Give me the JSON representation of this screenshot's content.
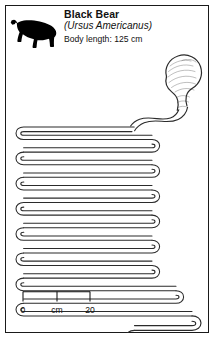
{
  "card": {
    "header": {
      "icon": "black-bear-silhouette-icon",
      "common_name": "Black Bear",
      "latin_name": "(Ursus Americanus)",
      "body_length_label": "Body length:",
      "body_length_value": "125 cm",
      "body_length_full": "Body length:  125 cm"
    },
    "diagram": {
      "title": "black-bear-digestive-tract",
      "parts": [
        {
          "name": "stomach",
          "label": ""
        },
        {
          "name": "small-intestine-coils",
          "label": ""
        },
        {
          "name": "large-intestine-colon",
          "label": ""
        },
        {
          "name": "rectum-terminus",
          "label": ""
        }
      ],
      "stroke_color": "#2b2b2b",
      "fill_color": "#ffffff"
    },
    "scale_bar": {
      "start_label": "0",
      "unit_label": "cm",
      "end_label": "20",
      "ticks": [
        "0",
        "cm",
        "20"
      ]
    },
    "colors": {
      "border": "#1a1a1a",
      "text": "#111111",
      "background": "#ffffff",
      "silhouette": "#000000"
    }
  }
}
